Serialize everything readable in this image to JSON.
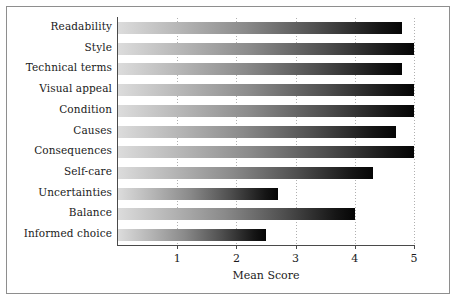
{
  "chart_data": {
    "type": "bar",
    "orientation": "horizontal",
    "title": "",
    "xlabel": "Mean Score",
    "ylabel": "",
    "xlim": [
      0,
      5
    ],
    "ylim": null,
    "grid": "vertical dotted gridlines at each integer tick",
    "legend": null,
    "xticks": [
      "1",
      "2",
      "3",
      "4",
      "5"
    ],
    "xtick_values": [
      1,
      2,
      3,
      4,
      5
    ],
    "categories": [
      "Readability",
      "Style",
      "Technical terms",
      "Visual appeal",
      "Condition",
      "Causes",
      "Consequences",
      "Self-care",
      "Uncertainties",
      "Balance",
      "Informed choice"
    ],
    "values": [
      4.8,
      5.0,
      4.8,
      5.0,
      5.0,
      4.7,
      5.0,
      4.3,
      2.7,
      4.0,
      2.5
    ],
    "bar_style": {
      "fill": "horizontal gradient light-grey to black",
      "gradient_start_color": "#dcdcdc",
      "gradient_end_color": "#050505"
    }
  }
}
